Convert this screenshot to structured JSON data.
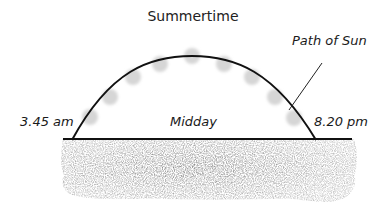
{
  "diagram": {
    "title": "Summertime",
    "labels": {
      "path": "Path of Sun",
      "sunrise": "3.45 am",
      "midday": "Midday",
      "sunset": "8.20 pm"
    },
    "sun_positions_count": 8,
    "colors": {
      "sun": "#d8d8d8",
      "path": "#111111",
      "ground": "#9a9a9a"
    }
  }
}
